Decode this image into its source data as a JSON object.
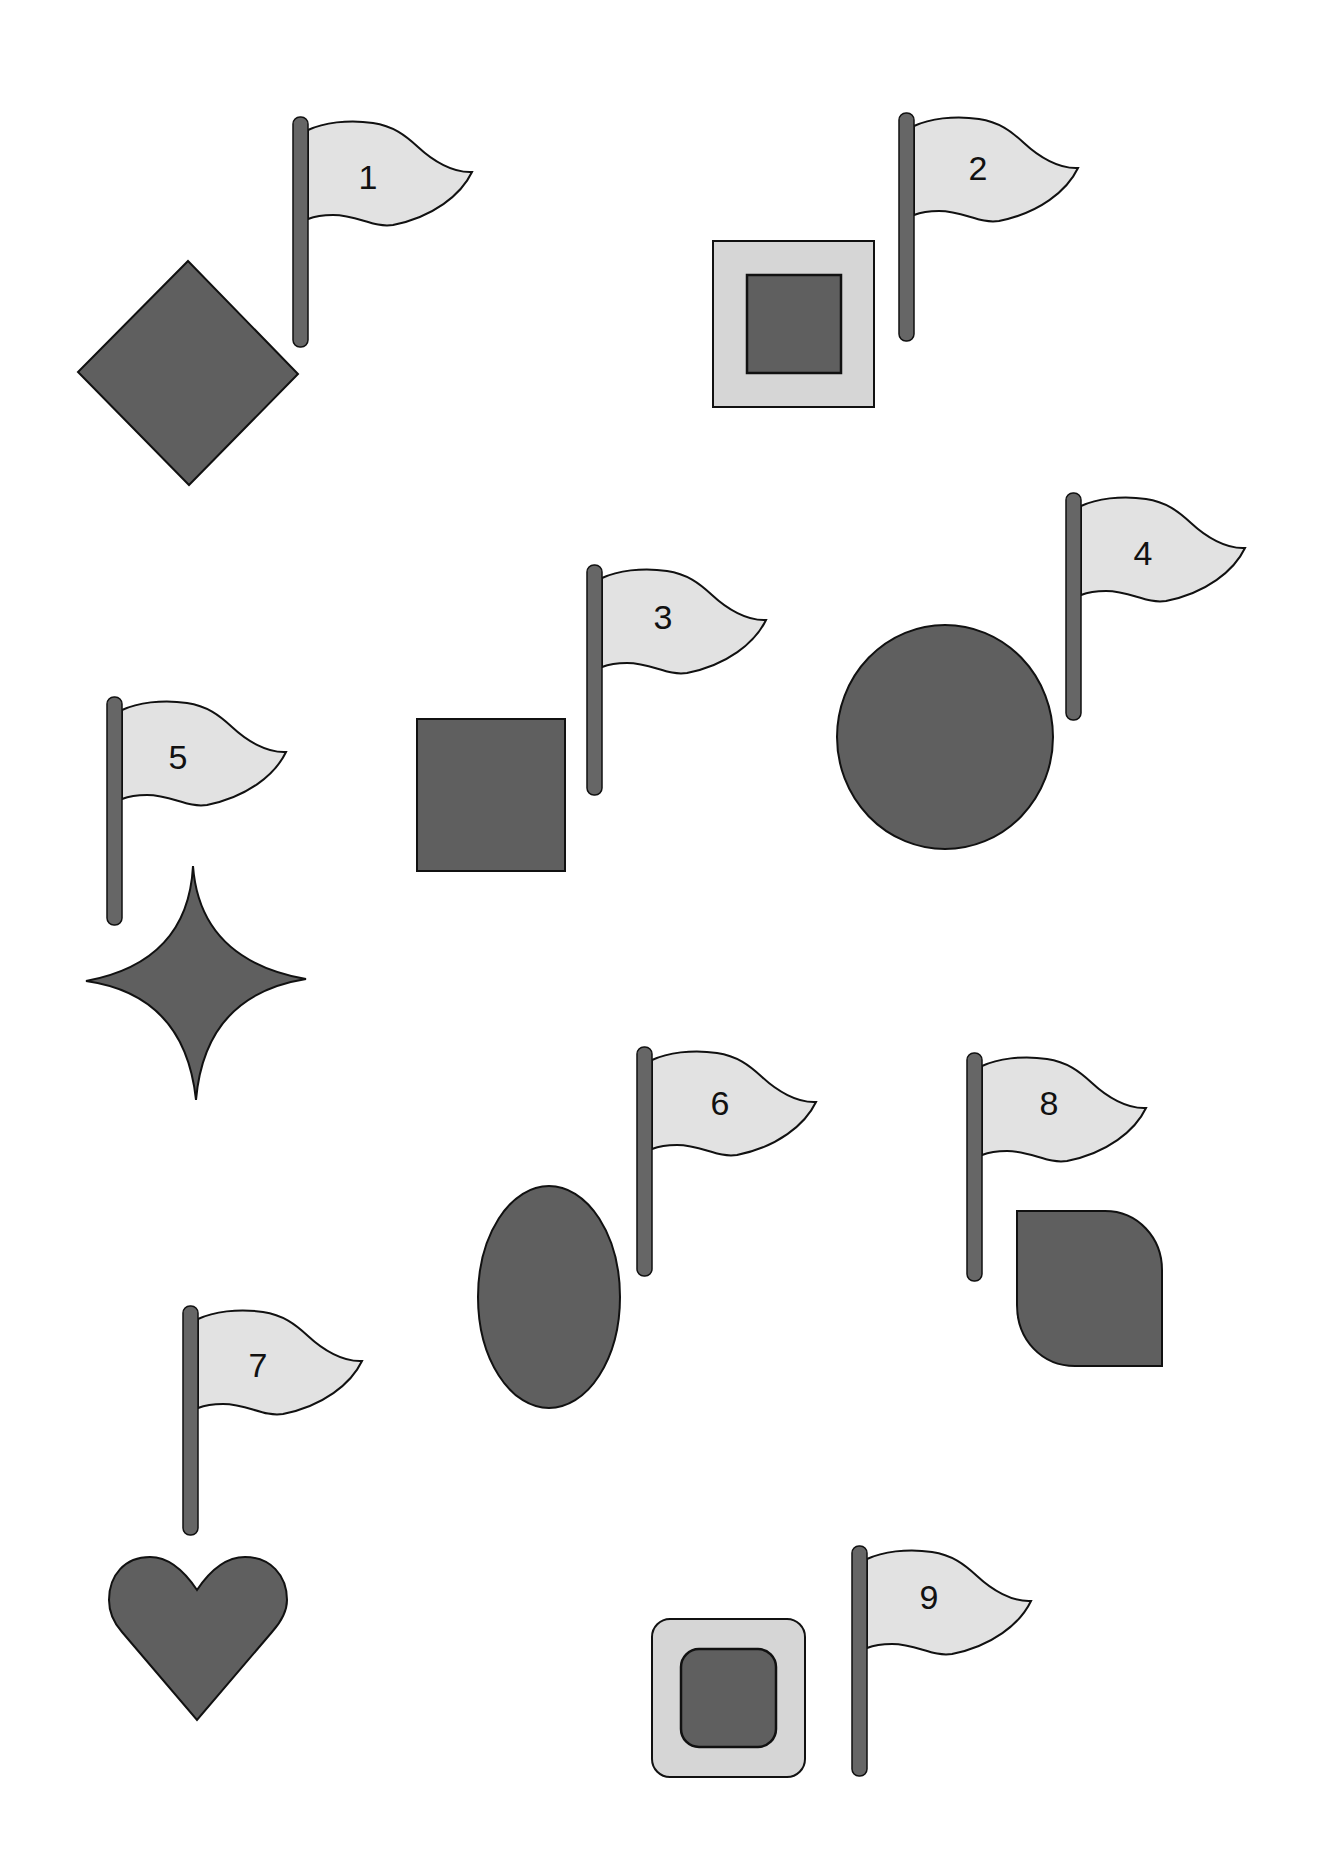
{
  "colors": {
    "background": "#ffffff",
    "shape_dark": "#5f5f5f",
    "shape_light": "#d6d6d6",
    "flag_fill": "#e2e2e2",
    "pole": "#666666",
    "stroke": "#111111"
  },
  "items": [
    {
      "number": "1",
      "shape": "diamond",
      "pole": {
        "x": 293,
        "y": 117
      }
    },
    {
      "number": "2",
      "shape": "square-in-square",
      "pole": {
        "x": 899,
        "y": 113
      }
    },
    {
      "number": "3",
      "shape": "square",
      "pole": {
        "x": 587,
        "y": 565
      }
    },
    {
      "number": "4",
      "shape": "circle",
      "pole": {
        "x": 1066,
        "y": 493
      }
    },
    {
      "number": "5",
      "shape": "four-point-star",
      "pole": {
        "x": 107,
        "y": 697
      }
    },
    {
      "number": "6",
      "shape": "ellipse",
      "pole": {
        "x": 637,
        "y": 1047
      }
    },
    {
      "number": "7",
      "shape": "heart",
      "pole": {
        "x": 183,
        "y": 1306
      }
    },
    {
      "number": "8",
      "shape": "leaf",
      "pole": {
        "x": 967,
        "y": 1053
      }
    },
    {
      "number": "9",
      "shape": "rounded-square-in-rounded-square",
      "pole": {
        "x": 852,
        "y": 1546
      }
    }
  ]
}
